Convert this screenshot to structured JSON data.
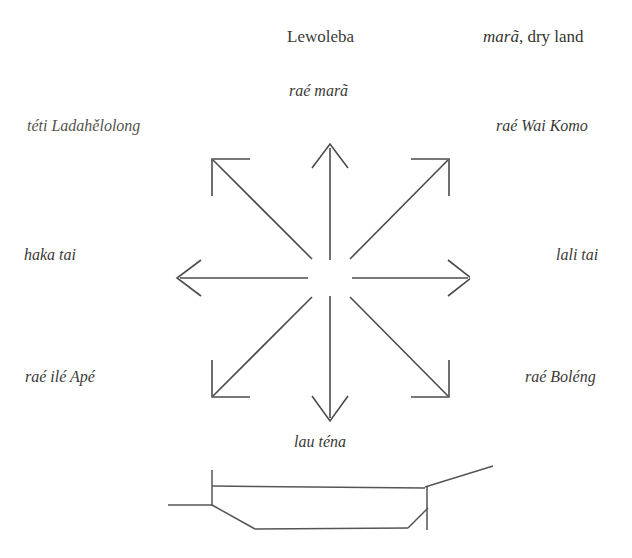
{
  "header": {
    "title": "Lewoleba",
    "right_label_italic": "marã",
    "right_label_rest": ", dry land",
    "rule_color": "#3a3a3a"
  },
  "compass": {
    "center_title": "raé marã",
    "directions": [
      {
        "position": "top",
        "label": "raé marã"
      },
      {
        "position": "top-left",
        "label": "téti Ladahělolong"
      },
      {
        "position": "top-right",
        "label": "raé Wai Komo"
      },
      {
        "position": "left",
        "label": "haka tai"
      },
      {
        "position": "right",
        "label": "lali tai"
      },
      {
        "position": "bottom-left",
        "label": "raé ilé Apé"
      },
      {
        "position": "bottom-right",
        "label": "raé Boléng"
      },
      {
        "position": "bottom",
        "label": "lau téna"
      }
    ],
    "arrow_count": 8,
    "line_color": "#4b4b4b"
  },
  "figure": {
    "boat_name": "boat-outline",
    "line_color": "#4b4b4b"
  }
}
